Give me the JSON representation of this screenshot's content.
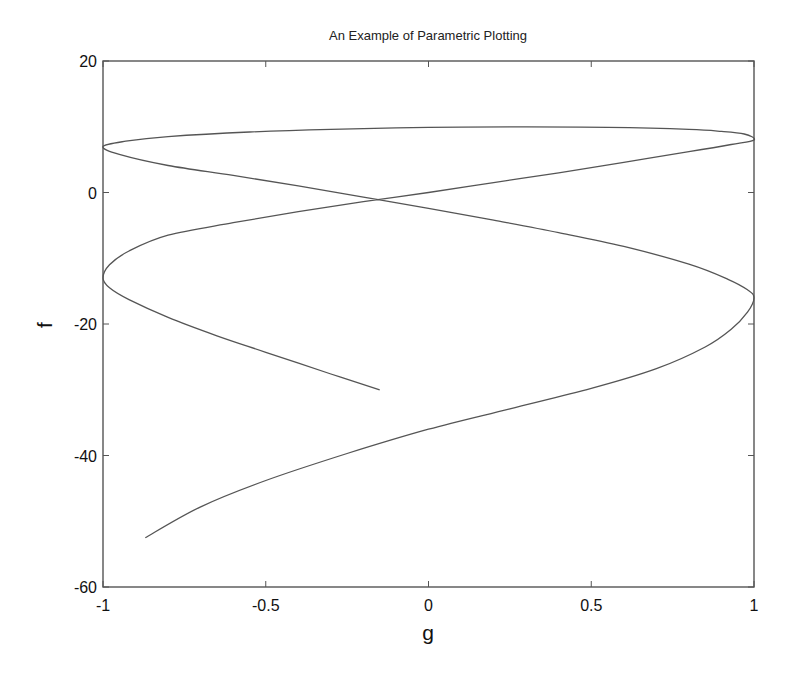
{
  "chart_data": {
    "type": "line",
    "title": "An Example of Parametric Plotting",
    "xlabel": "g",
    "ylabel": "f",
    "xlim": [
      -1,
      1
    ],
    "ylim": [
      -60,
      20
    ],
    "xticks": [
      -1,
      -0.5,
      0,
      0.5,
      1
    ],
    "xtick_labels": [
      "-1",
      "-0.5",
      "0",
      "0.5",
      "1"
    ],
    "yticks": [
      -60,
      -40,
      -20,
      0,
      20
    ],
    "ytick_labels": [
      "-60",
      "-40",
      "-20",
      "0",
      "20"
    ],
    "grid": false,
    "legend": null,
    "line_color": "#555555",
    "series": [
      {
        "name": "parametric curve (g, f)",
        "points": [
          [
            -0.15,
            -30.0
          ],
          [
            -0.3,
            -27.6
          ],
          [
            -0.5,
            -24.3
          ],
          [
            -0.65,
            -21.8
          ],
          [
            -0.8,
            -19.0
          ],
          [
            -0.92,
            -16.3
          ],
          [
            -0.98,
            -14.5
          ],
          [
            -1.0,
            -13.0
          ],
          [
            -0.98,
            -11.0
          ],
          [
            -0.92,
            -8.9
          ],
          [
            -0.8,
            -6.5
          ],
          [
            -0.6,
            -4.6
          ],
          [
            -0.4,
            -2.9
          ],
          [
            -0.2,
            -1.4
          ],
          [
            0.0,
            0.0
          ],
          [
            0.2,
            1.5
          ],
          [
            0.4,
            3.0
          ],
          [
            0.6,
            4.6
          ],
          [
            0.8,
            6.2
          ],
          [
            0.93,
            7.3
          ],
          [
            1.0,
            8.0
          ],
          [
            0.97,
            8.9
          ],
          [
            0.9,
            9.3
          ],
          [
            0.8,
            9.6
          ],
          [
            0.55,
            9.9
          ],
          [
            0.3,
            10.0
          ],
          [
            0.0,
            9.9
          ],
          [
            -0.3,
            9.6
          ],
          [
            -0.55,
            9.2
          ],
          [
            -0.8,
            8.5
          ],
          [
            -0.93,
            7.8
          ],
          [
            -1.0,
            7.0
          ],
          [
            -0.95,
            5.8
          ],
          [
            -0.8,
            4.1
          ],
          [
            -0.6,
            2.6
          ],
          [
            -0.4,
            1.0
          ],
          [
            -0.2,
            -0.7
          ],
          [
            0.0,
            -2.4
          ],
          [
            0.2,
            -4.2
          ],
          [
            0.4,
            -6.1
          ],
          [
            0.6,
            -8.2
          ],
          [
            0.8,
            -10.9
          ],
          [
            0.92,
            -13.2
          ],
          [
            0.98,
            -14.8
          ],
          [
            1.0,
            -16.0
          ],
          [
            0.98,
            -18.2
          ],
          [
            0.93,
            -20.8
          ],
          [
            0.85,
            -23.5
          ],
          [
            0.7,
            -26.8
          ],
          [
            0.5,
            -29.8
          ],
          [
            0.25,
            -32.9
          ],
          [
            0.0,
            -36.0
          ],
          [
            -0.25,
            -39.7
          ],
          [
            -0.5,
            -43.8
          ],
          [
            -0.7,
            -47.8
          ],
          [
            -0.87,
            -52.5
          ]
        ]
      }
    ]
  },
  "plot_area": {
    "left": 103,
    "top": 61,
    "right": 754,
    "bottom": 587
  }
}
